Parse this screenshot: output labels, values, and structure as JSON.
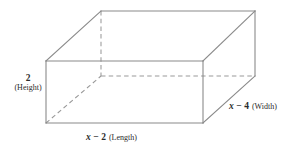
{
  "figure": {
    "type": "rectangular-prism-diagram",
    "canvas": {
      "width": 296,
      "height": 143,
      "background": "#ffffff"
    },
    "styling": {
      "solid_edge_color": "#8a8a8a",
      "hidden_edge_color": "#9a9a9a",
      "label_color": "#2b2b2b",
      "hidden_edge_dash": "4.5 3.2"
    },
    "geometry": {
      "front_face": {
        "left": 46,
        "top": 61,
        "right": 203,
        "bottom": 123
      },
      "depth_offset": {
        "dx": 55,
        "dy": -50
      },
      "vertices": {
        "front_top_left": [
          46,
          61
        ],
        "front_top_right": [
          203,
          61
        ],
        "front_bottom_left": [
          46,
          123
        ],
        "front_bottom_right": [
          203,
          123
        ],
        "back_top_left": [
          101,
          11
        ],
        "back_top_right": [
          255,
          11
        ],
        "back_bottom_left": [
          101,
          76
        ],
        "back_bottom_right": [
          255,
          76
        ]
      },
      "hidden_edges": [
        "back_top_left-to-back_bottom_left",
        "back_bottom_left-to-back_bottom_right",
        "back_bottom_left-to-front_bottom_left"
      ]
    },
    "labels": {
      "height": {
        "value": "2",
        "name": "(Height)",
        "position": "left"
      },
      "length": {
        "variable": "x",
        "operator": "−",
        "value": "2",
        "name": "(Length)",
        "position": "bottom"
      },
      "width": {
        "variable": "x",
        "operator": "−",
        "value": "4",
        "name": "(Width)",
        "position": "right"
      }
    }
  }
}
